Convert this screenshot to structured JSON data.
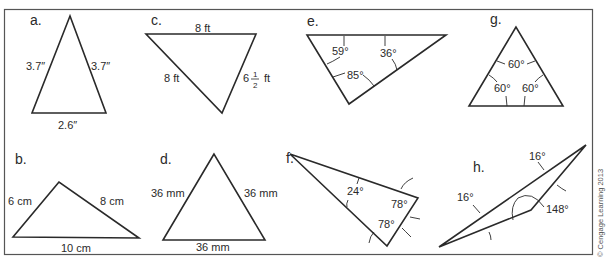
{
  "figure": {
    "credit": "© Cengage Learning 2013",
    "panels": [
      {
        "id": "a",
        "letter": "a.",
        "left_side": "3.7″",
        "right_side": "3.7″",
        "base": "2.6″"
      },
      {
        "id": "b",
        "letter": "b.",
        "left_side": "6 cm",
        "right_side": "8 cm",
        "base": "10 cm"
      },
      {
        "id": "c",
        "letter": "c.",
        "top_side": "8 ft",
        "left_side": "8 ft",
        "right_side_whole": "6",
        "right_side_num": "1",
        "right_side_den": "2",
        "right_side_unit": "ft"
      },
      {
        "id": "d",
        "letter": "d.",
        "left_side": "36 mm",
        "right_side": "36 mm",
        "base": "36 mm"
      },
      {
        "id": "e",
        "letter": "e.",
        "angle_left": "59°",
        "angle_right": "36°",
        "angle_bottom": "85°"
      },
      {
        "id": "f",
        "letter": "f.",
        "angle_top": "24°",
        "angle_right": "78°",
        "angle_bottom": "78°"
      },
      {
        "id": "g",
        "letter": "g.",
        "angle_top": "60°",
        "angle_left": "60°",
        "angle_right": "60°"
      },
      {
        "id": "h",
        "letter": "h.",
        "angle_top": "16°",
        "angle_left": "16°",
        "angle_obtuse": "148°"
      }
    ]
  },
  "colors": {
    "line": "#2a2a2a",
    "frame": "#555555",
    "background": "#ffffff"
  }
}
